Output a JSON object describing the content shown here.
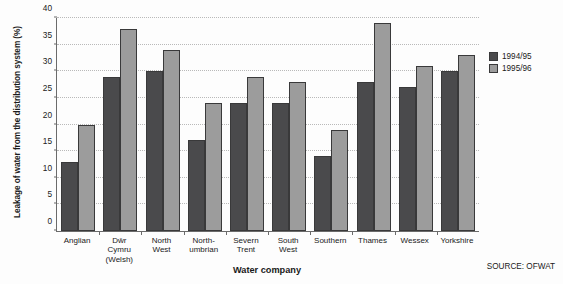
{
  "chart_data": {
    "type": "bar",
    "title": "",
    "xlabel": "Water company",
    "ylabel": "Leakage of water from the distribution system (%)",
    "ylim": [
      0,
      40
    ],
    "yticks": [
      0,
      5,
      10,
      15,
      20,
      25,
      30,
      35,
      40
    ],
    "grid": true,
    "legend_position": "right",
    "categories": [
      "Anglian",
      "Dŵr\nCymru\n(Welsh)",
      "North\nWest",
      "North-\numbrian",
      "Severn\nTrent",
      "South\nWest",
      "Southern",
      "Thames",
      "Wessex",
      "Yorkshire"
    ],
    "series": [
      {
        "name": "1994/95",
        "color": "#4a4a4c",
        "values": [
          13,
          29,
          30,
          17,
          24,
          24,
          14,
          28,
          27,
          30
        ]
      },
      {
        "name": "1995/96",
        "color": "#9c9c9c",
        "values": [
          20,
          38,
          34,
          24,
          29,
          28,
          19,
          39,
          31,
          33
        ]
      }
    ],
    "source": "SOURCE: OFWAT"
  }
}
